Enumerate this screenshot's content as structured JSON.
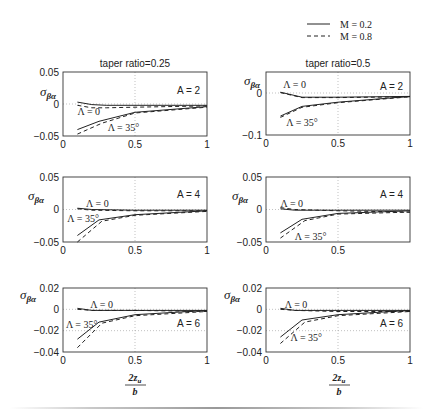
{
  "legend": {
    "entries": [
      {
        "label": "M = 0.2",
        "style": "solid"
      },
      {
        "label": "M = 0.8",
        "style": "dashed"
      }
    ]
  },
  "column_titles": [
    "taper ratio=0.25",
    "taper ratio=0.5"
  ],
  "ylabel": "σ",
  "ylabel_sub": "βα",
  "xlabel": {
    "numerator": "2z",
    "numerator_sub": "u",
    "denominator": "b"
  },
  "colors": {
    "line": "#222222",
    "frame": "#333333",
    "grid": "#999999",
    "text": "#222222"
  },
  "chart_data": [
    {
      "type": "line",
      "id": "tr025-A2",
      "title": "taper ratio=0.25",
      "annotation": "A = 2",
      "xlim": [
        0,
        1
      ],
      "ylim": [
        -0.05,
        0.05
      ],
      "xticks": [
        "0",
        "0.5",
        "1"
      ],
      "yticks": [
        "0.05",
        "0",
        "-0.05"
      ],
      "ytick_values": [
        0.05,
        0,
        -0.05
      ],
      "grid": true,
      "labels": [
        {
          "text": "Λ = 0",
          "x": 0.1,
          "y": -0.012
        },
        {
          "text": "Λ = 35°",
          "x": 0.31,
          "y": -0.038
        }
      ],
      "series": [
        {
          "name": "Λ=0, M=0.2",
          "style": "solid",
          "x": [
            0.1,
            0.2,
            0.3,
            0.5,
            1.0
          ],
          "y": [
            0.003,
            -0.001,
            -0.002,
            -0.002,
            -0.002
          ]
        },
        {
          "name": "Λ=0, M=0.8",
          "style": "dashed",
          "x": [
            0.1,
            0.2,
            0.3,
            0.5,
            1.0
          ],
          "y": [
            -0.002,
            -0.006,
            -0.006,
            -0.005,
            -0.003
          ]
        },
        {
          "name": "Λ=35°, M=0.2",
          "style": "solid",
          "x": [
            0.1,
            0.25,
            0.5,
            1.0
          ],
          "y": [
            -0.04,
            -0.027,
            -0.013,
            -0.004
          ]
        },
        {
          "name": "Λ=35°, M=0.8",
          "style": "dashed",
          "x": [
            0.1,
            0.27,
            0.5,
            1.0
          ],
          "y": [
            -0.047,
            -0.03,
            -0.014,
            -0.005
          ]
        }
      ]
    },
    {
      "type": "line",
      "id": "tr05-A2",
      "title": "taper ratio=0.5",
      "annotation": "A = 2",
      "xlim": [
        0,
        1
      ],
      "ylim": [
        -0.1,
        0.05
      ],
      "xticks": [
        "0",
        "0.5",
        "1"
      ],
      "yticks": [
        "0",
        "-0.1"
      ],
      "ytick_values": [
        0,
        -0.1
      ],
      "grid": true,
      "labels": [
        {
          "text": "Λ = 0",
          "x": 0.12,
          "y": 0.02
        },
        {
          "text": "Λ = 35°",
          "x": 0.14,
          "y": -0.072
        }
      ],
      "series": [
        {
          "name": "Λ=0, M=0.2",
          "style": "solid",
          "x": [
            0.1,
            0.25,
            0.5,
            1.0
          ],
          "y": [
            0.002,
            -0.01,
            -0.01,
            -0.008
          ]
        },
        {
          "name": "Λ=0, M=0.8",
          "style": "dashed",
          "x": [
            0.1,
            0.25,
            0.5,
            1.0
          ],
          "y": [
            0.001,
            -0.011,
            -0.011,
            -0.009
          ]
        },
        {
          "name": "Λ=35°, M=0.2",
          "style": "solid",
          "x": [
            0.1,
            0.25,
            0.5,
            1.0
          ],
          "y": [
            -0.055,
            -0.032,
            -0.022,
            -0.008
          ]
        },
        {
          "name": "Λ=35°, M=0.8",
          "style": "dashed",
          "x": [
            0.1,
            0.25,
            0.5,
            1.0
          ],
          "y": [
            -0.058,
            -0.034,
            -0.023,
            -0.009
          ]
        }
      ]
    },
    {
      "type": "line",
      "id": "tr025-A4",
      "title": "",
      "annotation": "A = 4",
      "xlim": [
        0,
        1
      ],
      "ylim": [
        -0.05,
        0.05
      ],
      "xticks": [
        "0",
        "0.5",
        "1"
      ],
      "yticks": [
        "0.05",
        "0",
        "-0.05"
      ],
      "ytick_values": [
        0.05,
        0,
        -0.05
      ],
      "grid": true,
      "labels": [
        {
          "text": "Λ = 0",
          "x": 0.16,
          "y": 0.008
        },
        {
          "text": "Λ = 35°",
          "x": 0.03,
          "y": -0.015
        }
      ],
      "series": [
        {
          "name": "Λ=0, M=0.2",
          "style": "solid",
          "x": [
            0.1,
            0.2,
            0.5,
            1.0
          ],
          "y": [
            0.002,
            0.0,
            -0.001,
            -0.001
          ]
        },
        {
          "name": "Λ=0, M=0.8",
          "style": "dashed",
          "x": [
            0.1,
            0.2,
            0.5,
            1.0
          ],
          "y": [
            0.001,
            -0.001,
            -0.002,
            -0.002
          ]
        },
        {
          "name": "Λ=35°, M=0.2",
          "style": "solid",
          "x": [
            0.1,
            0.25,
            0.5,
            1.0
          ],
          "y": [
            -0.04,
            -0.016,
            -0.008,
            -0.002
          ]
        },
        {
          "name": "Λ=35°, M=0.8",
          "style": "dashed",
          "x": [
            0.1,
            0.27,
            0.5,
            1.0
          ],
          "y": [
            -0.05,
            -0.018,
            -0.009,
            -0.003
          ]
        }
      ]
    },
    {
      "type": "line",
      "id": "tr05-A4",
      "title": "",
      "annotation": "A = 4",
      "xlim": [
        0,
        1
      ],
      "ylim": [
        -0.05,
        0.05
      ],
      "xticks": [
        "0",
        "0.5"
      ],
      "yticks": [
        "0.05",
        "0",
        "-0.05"
      ],
      "ytick_values": [
        0.05,
        0,
        -0.05
      ],
      "grid": true,
      "labels": [
        {
          "text": "Λ = 0",
          "x": 0.1,
          "y": 0.008
        },
        {
          "text": "Λ = 35°",
          "x": 0.2,
          "y": -0.042
        }
      ],
      "series": [
        {
          "name": "Λ=0, M=0.2",
          "style": "solid",
          "x": [
            0.1,
            0.2,
            0.5,
            1.0
          ],
          "y": [
            0.001,
            -0.001,
            -0.001,
            -0.001
          ]
        },
        {
          "name": "Λ=0, M=0.8",
          "style": "dashed",
          "x": [
            0.1,
            0.2,
            0.5,
            1.0
          ],
          "y": [
            0.003,
            0.0,
            -0.002,
            -0.004
          ]
        },
        {
          "name": "Λ=35°, M=0.2",
          "style": "solid",
          "x": [
            0.1,
            0.25,
            0.5,
            1.0
          ],
          "y": [
            -0.036,
            -0.015,
            -0.006,
            -0.002
          ]
        },
        {
          "name": "Λ=35°, M=0.8",
          "style": "dashed",
          "x": [
            0.1,
            0.27,
            0.5,
            1.0
          ],
          "y": [
            -0.044,
            -0.017,
            -0.007,
            -0.004
          ]
        }
      ]
    },
    {
      "type": "line",
      "id": "tr025-A6",
      "title": "",
      "annotation": "A = 6",
      "xlim": [
        0,
        1
      ],
      "ylim": [
        -0.04,
        0.02
      ],
      "xticks": [
        "0",
        "0.5",
        "1"
      ],
      "yticks": [
        "0.02",
        "0",
        "-0.02",
        "-0.04"
      ],
      "ytick_values": [
        0.02,
        0,
        -0.02,
        -0.04
      ],
      "grid": true,
      "labels": [
        {
          "text": "Λ = 0",
          "x": 0.19,
          "y": 0.004
        },
        {
          "text": "Λ = 35°",
          "x": 0.02,
          "y": -0.015
        }
      ],
      "series": [
        {
          "name": "Λ=0, M=0.2",
          "style": "solid",
          "x": [
            0.1,
            0.2,
            0.5,
            1.0
          ],
          "y": [
            0.001,
            -0.001,
            -0.001,
            -0.001
          ]
        },
        {
          "name": "Λ=0, M=0.8",
          "style": "dashed",
          "x": [
            0.1,
            0.2,
            0.5,
            1.0
          ],
          "y": [
            0.0,
            -0.001,
            -0.001,
            -0.002
          ]
        },
        {
          "name": "Λ=35°, M=0.2",
          "style": "solid",
          "x": [
            0.1,
            0.25,
            0.5,
            1.0
          ],
          "y": [
            -0.028,
            -0.012,
            -0.005,
            -0.001
          ]
        },
        {
          "name": "Λ=35°, M=0.8",
          "style": "dashed",
          "x": [
            0.1,
            0.27,
            0.5,
            1.0
          ],
          "y": [
            -0.036,
            -0.013,
            -0.006,
            -0.002
          ]
        }
      ]
    },
    {
      "type": "line",
      "id": "tr05-A6",
      "title": "",
      "annotation": "A = 6",
      "xlim": [
        0,
        1
      ],
      "ylim": [
        -0.04,
        0.02
      ],
      "xticks": [
        "0",
        "0.5",
        "1"
      ],
      "yticks": [
        "0.02",
        "0",
        "-0.02",
        "-0.04"
      ],
      "ytick_values": [
        0.02,
        0,
        -0.02,
        -0.04
      ],
      "grid": true,
      "labels": [
        {
          "text": "Λ = 0",
          "x": 0.13,
          "y": 0.004
        },
        {
          "text": "Λ = 35°",
          "x": 0.17,
          "y": -0.027
        }
      ],
      "series": [
        {
          "name": "Λ=0, M=0.2",
          "style": "solid",
          "x": [
            0.1,
            0.2,
            0.5,
            1.0
          ],
          "y": [
            0.001,
            -0.001,
            -0.001,
            -0.001
          ]
        },
        {
          "name": "Λ=0, M=0.8",
          "style": "dashed",
          "x": [
            0.1,
            0.2,
            0.5,
            1.0
          ],
          "y": [
            0.0,
            -0.001,
            -0.002,
            -0.002
          ]
        },
        {
          "name": "Λ=35°, M=0.2",
          "style": "solid",
          "x": [
            0.1,
            0.25,
            0.5,
            1.0
          ],
          "y": [
            -0.026,
            -0.01,
            -0.005,
            -0.001
          ]
        },
        {
          "name": "Λ=35°, M=0.8",
          "style": "dashed",
          "x": [
            0.1,
            0.27,
            0.5,
            1.0
          ],
          "y": [
            -0.032,
            -0.012,
            -0.006,
            -0.002
          ]
        }
      ]
    }
  ]
}
